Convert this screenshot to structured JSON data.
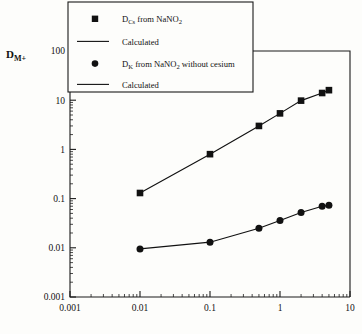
{
  "chart_data": {
    "type": "scatter",
    "title": "",
    "xlabel": "",
    "ylabel": "D_M+",
    "xscale": "log",
    "yscale": "log",
    "xlim": [
      0.001,
      10
    ],
    "ylim": [
      0.001,
      100
    ],
    "xticks": [
      "0.001",
      "0.01",
      "0.1",
      "1",
      "10"
    ],
    "xtick_values": [
      0.001,
      0.01,
      0.1,
      1,
      10
    ],
    "yticks": [
      "0.001",
      "0.01",
      "0.1",
      "1",
      "10",
      "100"
    ],
    "ytick_values": [
      0.001,
      0.01,
      0.1,
      1,
      10,
      100
    ],
    "grid": false,
    "legend_position": "top-left-outside",
    "x": [
      0.01,
      0.1,
      0.5,
      1,
      2,
      4,
      5
    ],
    "series": [
      {
        "name": "D_Cs from NaNO2",
        "marker": "square",
        "values": [
          0.13,
          0.8,
          3.0,
          5.4,
          9.8,
          14.0,
          16.0
        ],
        "line": "Calculated"
      },
      {
        "name": "D_K from NaNO2 without cesium",
        "marker": "circle",
        "values": [
          0.0095,
          0.013,
          0.025,
          0.036,
          0.052,
          0.07,
          0.073
        ],
        "line": "Calculated"
      }
    ]
  },
  "axis": {
    "ylabel_main": "D",
    "ylabel_subscript": "M+"
  },
  "legend": {
    "entries": [
      {
        "marker": "square",
        "text_pre": "D",
        "text_sub": "Cs",
        "text_mid": " from NaNO",
        "text_sub2": "2",
        "text_post": ""
      },
      {
        "marker": "line",
        "text_pre": "Calculated",
        "text_sub": "",
        "text_mid": "",
        "text_sub2": "",
        "text_post": ""
      },
      {
        "marker": "circle",
        "text_pre": "D",
        "text_sub": "K",
        "text_mid": " from NaNO",
        "text_sub2": "2",
        "text_post": " without cesium"
      },
      {
        "marker": "line",
        "text_pre": "Calculated",
        "text_sub": "",
        "text_mid": "",
        "text_sub2": "",
        "text_post": ""
      }
    ]
  },
  "colors": {
    "ink": "#111111",
    "paper": "#fdfdfb"
  }
}
